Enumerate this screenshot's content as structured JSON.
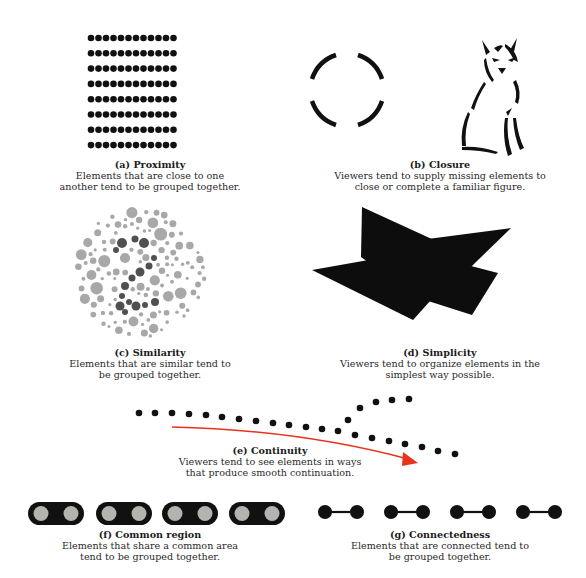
{
  "figure": {
    "panels": [
      {
        "id": "a",
        "letter": "a",
        "title": "Proximity",
        "desc_line1": "Elements that are close to one",
        "desc_line2": "another tend to be grouped together.",
        "illustration": "12x8 grid of black dots"
      },
      {
        "id": "b",
        "letter": "b",
        "title": "Closure",
        "desc_line1": "Viewers tend to supply missing elements to",
        "desc_line2": "close or complete a familiar figure.",
        "illustration": "broken circle arcs and partial outline of a sitting wolf"
      },
      {
        "id": "c",
        "letter": "c",
        "title": "Similarity",
        "desc_line1": "Elements that are similar tend to",
        "desc_line2": "be grouped together.",
        "illustration": "circle of grey dots with darker dots forming the number 2"
      },
      {
        "id": "d",
        "letter": "d",
        "title": "Simplicity",
        "desc_line1": "Viewers tend to organize elements in the",
        "desc_line2": "simplest way possible.",
        "illustration": "overlapping black polygons"
      },
      {
        "id": "e",
        "letter": "e",
        "title": "Continuity",
        "desc_line1": "Viewers tend to see elements in ways",
        "desc_line2": "that produce smooth continuation.",
        "illustration": "line of dots that branches, with red curved arrow"
      },
      {
        "id": "f",
        "letter": "f",
        "title": "Common region",
        "desc_line1": "Elements that share a common area",
        "desc_line2": "tend to be grouped together.",
        "illustration": "four black capsules each containing two grey dots"
      },
      {
        "id": "g",
        "letter": "g",
        "title": "Connectedness",
        "desc_line1": "Elements that are connected tend to",
        "desc_line2": "be grouped together.",
        "illustration": "four pairs of black dots joined by lines"
      }
    ],
    "colors": {
      "ink": "#111111",
      "light_grey_dot": "#a8a8a8",
      "dark_grey_dot": "#505050",
      "capsule_dot": "#b4b4ae",
      "arrow": "#e8321e",
      "text": "#2a2a2a"
    }
  }
}
